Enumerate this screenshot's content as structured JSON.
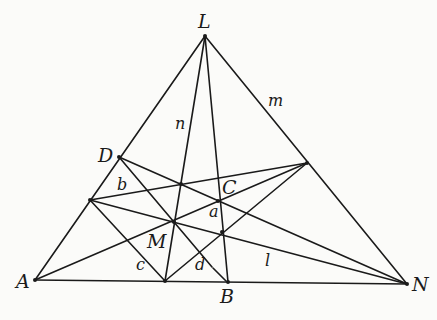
{
  "diagram": {
    "title": "",
    "points": {
      "L": [
        205,
        36
      ],
      "A": [
        35,
        280
      ],
      "N": [
        407,
        284
      ],
      "D": [
        119,
        157
      ],
      "P": [
        90,
        200
      ],
      "Q": [
        307,
        163
      ],
      "X": [
        181,
        184
      ],
      "C": [
        218,
        201
      ],
      "M": [
        174,
        222
      ],
      "R": [
        222,
        232
      ],
      "S": [
        165,
        281
      ],
      "B": [
        228,
        282
      ]
    },
    "labels": {
      "L": "L",
      "m": "m",
      "n": "n",
      "D": "D",
      "b": "b",
      "C": "C",
      "a": "a",
      "M": "M",
      "A": "A",
      "c": "c",
      "d": "d",
      "B": "B",
      "l": "l",
      "N": "N"
    }
  }
}
